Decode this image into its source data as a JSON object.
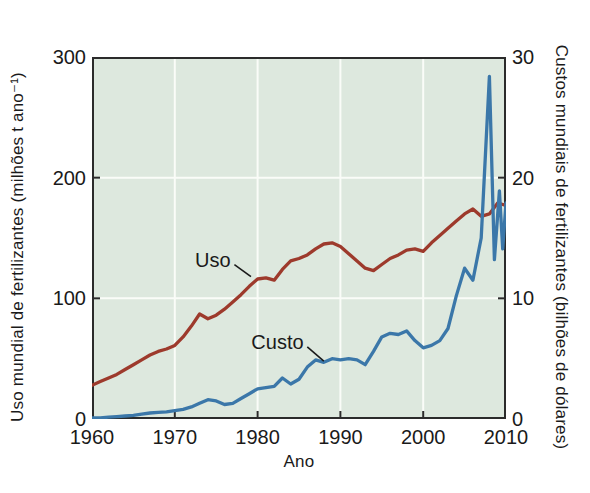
{
  "figure": {
    "background": "#ffffff",
    "text_color": "#1a1a1a"
  },
  "chart_data": {
    "type": "line",
    "title": "",
    "xlabel": "Ano",
    "xlim": [
      1960,
      2010
    ],
    "x_ticks": [
      1960,
      1970,
      1980,
      1990,
      2000,
      2010
    ],
    "grid": true,
    "plot_bg_color": "#dde8de",
    "grid_color": "#fafcf8",
    "axis_color": "#2b2b2b",
    "legend_position": "inline-annotations",
    "left_axis": {
      "label": "Uso mundial de fertilizantes (milhões t ano⁻¹)",
      "lim": [
        0,
        300
      ],
      "ticks": [
        0,
        100,
        200,
        300
      ]
    },
    "right_axis": {
      "label": "Custos mundiais de fertilizantes (bilhões de dólares)",
      "lim": [
        0,
        30
      ],
      "ticks": [
        0,
        10,
        20,
        30
      ]
    },
    "series": [
      {
        "name": "Uso",
        "axis": "left",
        "color": "#9d3a2c",
        "x": [
          1960,
          1961,
          1962,
          1963,
          1964,
          1965,
          1966,
          1967,
          1968,
          1969,
          1970,
          1971,
          1972,
          1973,
          1974,
          1975,
          1976,
          1977,
          1978,
          1979,
          1980,
          1981,
          1982,
          1983,
          1984,
          1985,
          1986,
          1987,
          1988,
          1989,
          1990,
          1991,
          1992,
          1993,
          1994,
          1995,
          1996,
          1997,
          1998,
          1999,
          2000,
          2001,
          2002,
          2003,
          2004,
          2005,
          2006,
          2007,
          2008,
          2009,
          2010
        ],
        "values": [
          28,
          31,
          34,
          37,
          41,
          45,
          49,
          53,
          56,
          58,
          61,
          68,
          77,
          87,
          83,
          86,
          91,
          97,
          103,
          110,
          116,
          117,
          115,
          124,
          131,
          133,
          136,
          141,
          145,
          146,
          143,
          137,
          131,
          125,
          123,
          128,
          133,
          136,
          140,
          141,
          139,
          146,
          152,
          158,
          164,
          170,
          174,
          168,
          170,
          179,
          177
        ]
      },
      {
        "name": "Custo",
        "axis": "right",
        "color": "#3b77a9",
        "x": [
          1960,
          1961,
          1962,
          1963,
          1964,
          1965,
          1966,
          1967,
          1968,
          1969,
          1970,
          1971,
          1972,
          1973,
          1974,
          1975,
          1976,
          1977,
          1978,
          1979,
          1980,
          1981,
          1982,
          1983,
          1984,
          1985,
          1986,
          1987,
          1988,
          1989,
          1990,
          1991,
          1992,
          1993,
          1994,
          1995,
          1996,
          1997,
          1998,
          1999,
          2000,
          2001,
          2002,
          2003,
          2004,
          2005,
          2006,
          2007,
          2008,
          2008.6,
          2009.2,
          2009.6,
          2010
        ],
        "values": [
          0.1,
          0.1,
          0.15,
          0.2,
          0.25,
          0.3,
          0.4,
          0.5,
          0.55,
          0.6,
          0.7,
          0.8,
          1.0,
          1.3,
          1.6,
          1.5,
          1.2,
          1.3,
          1.7,
          2.1,
          2.5,
          2.6,
          2.7,
          3.4,
          2.9,
          3.3,
          4.3,
          4.9,
          4.7,
          5.0,
          4.9,
          5.0,
          4.9,
          4.5,
          5.6,
          6.8,
          7.1,
          7.0,
          7.3,
          6.5,
          5.9,
          6.1,
          6.5,
          7.5,
          10.2,
          12.5,
          11.5,
          15.0,
          28.4,
          13.2,
          18.9,
          14.1,
          17.9
        ]
      }
    ],
    "annotations": [
      {
        "text": "Uso",
        "axis": "left",
        "tx": 1974.6,
        "ty": 132,
        "line": [
          [
            1977.2,
            128
          ],
          [
            1979.2,
            118
          ]
        ]
      },
      {
        "text": "Custo",
        "axis": "right",
        "tx": 1982.4,
        "ty": 6.35,
        "line": [
          [
            1986.0,
            5.97
          ],
          [
            1988.0,
            4.8
          ]
        ]
      }
    ]
  }
}
